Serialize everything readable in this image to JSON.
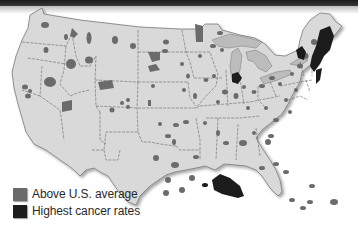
{
  "map": {
    "subject": "U.S. counties by cancer mortality rate",
    "colors": {
      "land": "#d9d9d9",
      "border": "#555555",
      "lakes": "#bcbcbc",
      "above_average": "#6b6b6b",
      "highest": "#1c1c1c",
      "background": "#ffffff"
    }
  },
  "legend": {
    "items": [
      {
        "label": "Above U.S. average",
        "color": "#6b6b6b"
      },
      {
        "label": "Highest cancer rates",
        "color": "#1c1c1c"
      }
    ]
  }
}
